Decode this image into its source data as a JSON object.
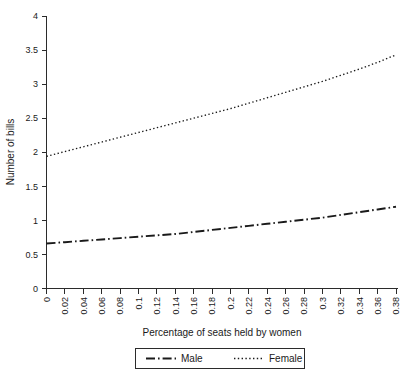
{
  "chart_data": {
    "type": "line",
    "title": "",
    "xlabel": "Percentage of seats held by women",
    "ylabel": "Number of bills",
    "xlim": [
      0,
      0.38
    ],
    "ylim": [
      0,
      4
    ],
    "grid": false,
    "legend_position": "bottom-center",
    "x_tick_labels": [
      "0",
      "0.02",
      "0.04",
      "0.06",
      "0.08",
      "0.1",
      "0.12",
      "0.14",
      "0.16",
      "0.18",
      "0.2",
      "0.22",
      "0.24",
      "0.26",
      "0.28",
      "0.3",
      "0.32",
      "0.34",
      "0.36",
      "0.38"
    ],
    "x_tick_values": [
      0,
      0.02,
      0.04,
      0.06,
      0.08,
      0.1,
      0.12,
      0.14,
      0.16,
      0.18,
      0.2,
      0.22,
      0.24,
      0.26,
      0.28,
      0.3,
      0.32,
      0.34,
      0.36,
      0.38
    ],
    "y_tick_labels": [
      "0",
      "0.5",
      "1",
      "1.5",
      "2",
      "2.5",
      "3",
      "3.5",
      "4"
    ],
    "y_tick_values": [
      0,
      0.5,
      1,
      1.5,
      2,
      2.5,
      3,
      3.5,
      4
    ],
    "x": [
      0,
      0.02,
      0.04,
      0.06,
      0.08,
      0.1,
      0.12,
      0.14,
      0.16,
      0.18,
      0.2,
      0.22,
      0.24,
      0.26,
      0.28,
      0.3,
      0.32,
      0.34,
      0.36,
      0.38
    ],
    "series": [
      {
        "name": "Male",
        "style": "dash-dot",
        "color": "#1a1a1a",
        "values": [
          0.66,
          0.68,
          0.7,
          0.72,
          0.74,
          0.76,
          0.78,
          0.8,
          0.83,
          0.86,
          0.89,
          0.92,
          0.95,
          0.98,
          1.01,
          1.04,
          1.08,
          1.12,
          1.16,
          1.2
        ]
      },
      {
        "name": "Female",
        "style": "dotted",
        "color": "#1a1a1a",
        "values": [
          1.94,
          2.01,
          2.08,
          2.15,
          2.22,
          2.29,
          2.36,
          2.43,
          2.5,
          2.57,
          2.64,
          2.72,
          2.8,
          2.88,
          2.96,
          3.04,
          3.13,
          3.22,
          3.32,
          3.43
        ]
      }
    ]
  },
  "legend": {
    "items": [
      {
        "label": "Male",
        "style": "dash-dot"
      },
      {
        "label": "Female",
        "style": "dotted"
      }
    ]
  }
}
